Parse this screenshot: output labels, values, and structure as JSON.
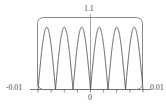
{
  "chart_data": {
    "type": "line",
    "title": "",
    "xlabel": "",
    "ylabel": "",
    "xlim": [
      -0.01,
      0.01
    ],
    "ylim": [
      0.0,
      1.1
    ],
    "grid": false,
    "legend": null,
    "frame": "rounded-rectangle",
    "tick_labels": {
      "y_max": "1.1",
      "x_min": "-0.01",
      "x_max": "0.01",
      "x_zero": "0"
    },
    "x_ticks": [
      -0.01,
      -0.0075,
      -0.005,
      -0.0025,
      0,
      0.0025,
      0.005,
      0.0075,
      0.01
    ],
    "y_ticks": [
      0,
      1.1
    ],
    "series": [
      {
        "name": "oscillation",
        "description": "rectified high-frequency oscillation, 6 peaks across the x-range",
        "color": "#4a4a4a",
        "linewidth": 0.9,
        "peaks_x": [
          -0.00833,
          -0.005,
          -0.00167,
          0.00167,
          0.005,
          0.00833
        ],
        "peaks_y": [
          1.0,
          1.0,
          1.0,
          1.0,
          1.0,
          1.0
        ],
        "troughs_x": [
          -0.01,
          -0.00667,
          -0.00333,
          0.0,
          0.00333,
          0.00667,
          0.01
        ],
        "troughs_y": [
          0,
          0,
          0,
          0,
          0,
          0,
          0
        ],
        "period": 0.003333,
        "amplitude": 1.0
      }
    ],
    "annotations": [
      {
        "name": "center-vertical-axis",
        "x": 0,
        "from_y": 1.1,
        "to_y": 0
      },
      {
        "name": "bottom-horizontal-axis",
        "y": 0,
        "from_x": -0.01,
        "to_x": 0.01
      }
    ]
  },
  "colors": {
    "background": "#ffffff",
    "curve": "#4a4a4a",
    "frame": "#6e6e6e",
    "axis": "#6e6e6e",
    "text": "#4a4a4a"
  }
}
